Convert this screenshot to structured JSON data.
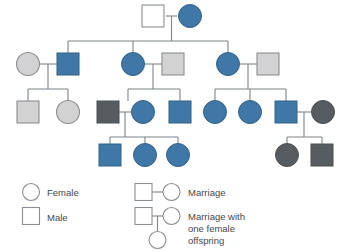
{
  "diagram": {
    "colors": {
      "affected_blue": "#3F78A6",
      "light_gray": "#D2D2D2",
      "dark_gray": "#575C60",
      "unfilled": "#FFFFFF",
      "outline": "#8A8F94",
      "line": "#7E8489",
      "text": "#44484b"
    },
    "generations": [
      {
        "id": "I",
        "individuals": [
          {
            "id": "I-1",
            "shape": "square",
            "sex": "male",
            "fill": "unfilled",
            "x": 153,
            "y": 16
          },
          {
            "id": "I-2",
            "shape": "circle",
            "sex": "female",
            "fill": "affected_blue",
            "x": 190,
            "y": 16
          }
        ]
      },
      {
        "id": "II",
        "individuals": [
          {
            "id": "II-1",
            "shape": "circle",
            "sex": "female",
            "fill": "light_gray",
            "x": 28,
            "y": 64
          },
          {
            "id": "II-2",
            "shape": "square",
            "sex": "male",
            "fill": "affected_blue",
            "x": 68,
            "y": 64
          },
          {
            "id": "II-3",
            "shape": "circle",
            "sex": "female",
            "fill": "affected_blue",
            "x": 133,
            "y": 64
          },
          {
            "id": "II-4",
            "shape": "square",
            "sex": "male",
            "fill": "light_gray",
            "x": 173,
            "y": 64
          },
          {
            "id": "II-5",
            "shape": "circle",
            "sex": "female",
            "fill": "affected_blue",
            "x": 228,
            "y": 64
          },
          {
            "id": "II-6",
            "shape": "square",
            "sex": "male",
            "fill": "light_gray",
            "x": 268,
            "y": 64
          }
        ]
      },
      {
        "id": "III",
        "individuals": [
          {
            "id": "III-1",
            "shape": "square",
            "sex": "male",
            "fill": "light_gray",
            "x": 28,
            "y": 112
          },
          {
            "id": "III-2",
            "shape": "circle",
            "sex": "female",
            "fill": "light_gray",
            "x": 68,
            "y": 112
          },
          {
            "id": "III-3",
            "shape": "square",
            "sex": "male",
            "fill": "dark_gray",
            "x": 108,
            "y": 112
          },
          {
            "id": "III-4",
            "shape": "circle",
            "sex": "female",
            "fill": "affected_blue",
            "x": 143,
            "y": 112
          },
          {
            "id": "III-5",
            "shape": "square",
            "sex": "male",
            "fill": "affected_blue",
            "x": 180,
            "y": 112
          },
          {
            "id": "III-6",
            "shape": "circle",
            "sex": "female",
            "fill": "affected_blue",
            "x": 215,
            "y": 112
          },
          {
            "id": "III-7",
            "shape": "circle",
            "sex": "female",
            "fill": "affected_blue",
            "x": 250,
            "y": 112
          },
          {
            "id": "III-8",
            "shape": "square",
            "sex": "male",
            "fill": "affected_blue",
            "x": 286,
            "y": 112
          },
          {
            "id": "III-9",
            "shape": "circle",
            "sex": "female",
            "fill": "dark_gray",
            "x": 323,
            "y": 112
          }
        ]
      },
      {
        "id": "IV",
        "individuals": [
          {
            "id": "IV-1",
            "shape": "square",
            "sex": "male",
            "fill": "affected_blue",
            "x": 110,
            "y": 155
          },
          {
            "id": "IV-2",
            "shape": "circle",
            "sex": "female",
            "fill": "affected_blue",
            "x": 145,
            "y": 155
          },
          {
            "id": "IV-3",
            "shape": "circle",
            "sex": "female",
            "fill": "affected_blue",
            "x": 178,
            "y": 155
          },
          {
            "id": "IV-4",
            "shape": "circle",
            "sex": "female",
            "fill": "dark_gray",
            "x": 287,
            "y": 155
          },
          {
            "id": "IV-5",
            "shape": "square",
            "sex": "male",
            "fill": "dark_gray",
            "x": 322,
            "y": 155
          }
        ]
      }
    ]
  },
  "legend": {
    "female_label": "Female",
    "male_label": "Male",
    "marriage_label": "Marriage",
    "marriage_offspring_label_line1": "Marriage with",
    "marriage_offspring_label_line2": "one female",
    "marriage_offspring_label_line3": "offspring"
  }
}
